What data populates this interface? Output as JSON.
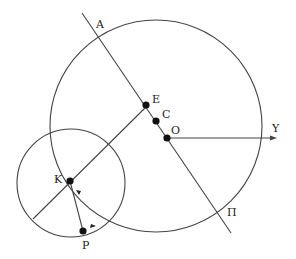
{
  "diagram": {
    "labels": {
      "A": "A",
      "E": "E",
      "C": "C",
      "O": "O",
      "Y": "Y",
      "K": "K",
      "P": "P",
      "Pi": "Π"
    },
    "stroke_color": "#444444",
    "point_color": "#111111"
  }
}
